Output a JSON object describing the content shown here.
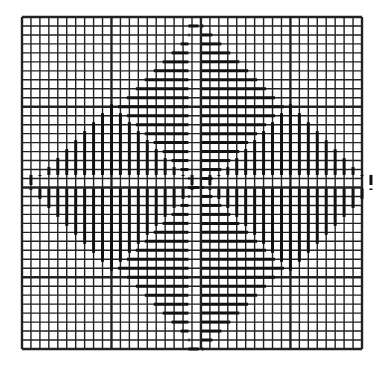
{
  "figure": {
    "colors": {
      "background": "#ffffff",
      "grid": "#222222",
      "stroke": "#111111"
    },
    "grid": {
      "origin_x": 22,
      "origin_y": 17,
      "width": 340,
      "height": 332,
      "cols": 38,
      "rows": 37,
      "major_cols": [
        0,
        10,
        20,
        30,
        38
      ],
      "major_rows": [
        0,
        10,
        19,
        29,
        37
      ],
      "minor_width": 1.4,
      "major_width": 2.4
    },
    "center": {
      "col": 20,
      "row": 19
    },
    "diamonds": [
      {
        "name": "top",
        "orientation": "horizontal",
        "center_col": 20,
        "center_row": 10,
        "radius": 9.5
      },
      {
        "name": "bottom",
        "orientation": "horizontal",
        "center_col": 20,
        "center_row": 28,
        "radius": 9.5
      },
      {
        "name": "left",
        "orientation": "vertical",
        "center_col": 10,
        "center_row": 19,
        "radius": 9.5
      },
      {
        "name": "right",
        "orientation": "vertical",
        "center_col": 30,
        "center_row": 19,
        "radius": 9.5
      }
    ]
  }
}
